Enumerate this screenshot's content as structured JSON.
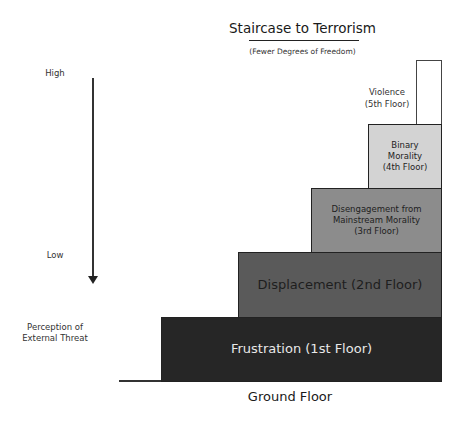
{
  "title": "Staircase to Terrorism",
  "subtitle": "(Fewer Degrees of Freedom)",
  "axis": {
    "high_label": "High",
    "low_label": "Low",
    "perception_label": "Perception of\nExternal Threat",
    "arrow_direction": "down"
  },
  "ground_label": "Ground Floor",
  "floors": [
    {
      "level": 1,
      "label": "Frustration (1st Floor)",
      "fill": "#262626",
      "text_color": "#e8e8e8"
    },
    {
      "level": 2,
      "label": "Displacement (2nd Floor)",
      "fill": "#5a5a5a",
      "text_color": "#1e1e1e"
    },
    {
      "level": 3,
      "label": "Disengagement from\nMainstream Morality\n(3rd Floor)",
      "fill": "#8c8c8c",
      "text_color": "#1e1e1e"
    },
    {
      "level": 4,
      "label": "Binary\nMorality\n(4th Floor)",
      "fill": "#d3d3d3",
      "text_color": "#1e1e1e"
    },
    {
      "level": 5,
      "label": "Violence\n(5th Floor)",
      "fill": "#ffffff",
      "text_color": "#333333"
    }
  ]
}
